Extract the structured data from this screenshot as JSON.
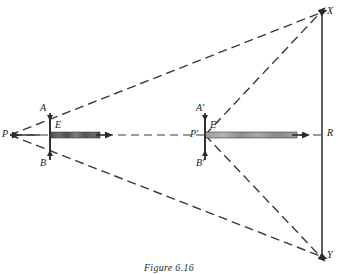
{
  "figure": {
    "caption": "Figure 6.16",
    "caption_y": 262
  },
  "colors": {
    "stroke": "#2b2b2b",
    "dash": "#3a3a3a",
    "beam_dark": "#5a5a5a",
    "beam_light": "#8d8d8d",
    "beam_edge": "#3d3d3d",
    "background": "#ffffff",
    "label": "#1a1a1a"
  },
  "points": [
    {
      "name": "P",
      "label": "P",
      "x": 10,
      "y": 135,
      "label_x": 2,
      "label_y": 130
    },
    {
      "name": "A",
      "label": "A",
      "x": 50,
      "y": 115,
      "label_x": 40,
      "label_y": 104
    },
    {
      "name": "E",
      "label": "E",
      "x": 50,
      "y": 135,
      "label_x": 55,
      "label_y": 122
    },
    {
      "name": "B",
      "label": "B",
      "x": 50,
      "y": 158,
      "label_x": 40,
      "label_y": 158
    },
    {
      "name": "P'",
      "label": "P'",
      "x": 205,
      "y": 135,
      "label_x": 192,
      "label_y": 130
    },
    {
      "name": "A'",
      "label": "A'",
      "x": 205,
      "y": 115,
      "label_x": 196,
      "label_y": 104
    },
    {
      "name": "E'",
      "label": "E'",
      "x": 205,
      "y": 135,
      "label_x": 210,
      "label_y": 122
    },
    {
      "name": "B'",
      "label": "B'",
      "x": 205,
      "y": 158,
      "label_x": 196,
      "label_y": 158
    },
    {
      "name": "X",
      "label": "X",
      "x": 322,
      "y": 12,
      "label_x": 327,
      "label_y": 6
    },
    {
      "name": "R",
      "label": "R",
      "x": 322,
      "y": 135,
      "label_x": 327,
      "label_y": 129
    },
    {
      "name": "Y",
      "label": "Y",
      "x": 322,
      "y": 257,
      "label_x": 327,
      "label_y": 249
    }
  ],
  "screen_line": {
    "x": 322,
    "y_top": 12,
    "y_bottom": 257
  },
  "axis": {
    "y": 135,
    "x_start": 10,
    "x_end": 322
  },
  "apertures": [
    {
      "name": "aperture-left",
      "x": 50,
      "y_top": 115,
      "y_bottom": 158
    },
    {
      "name": "aperture-right",
      "x": 205,
      "y_top": 115,
      "y_bottom": 158
    }
  ],
  "beams": [
    {
      "name": "beam-left",
      "x_start": 50,
      "x_end": 103,
      "y": 135,
      "thickness": 6,
      "shade": "dark"
    },
    {
      "name": "beam-right",
      "x_start": 205,
      "x_end": 300,
      "y": 135,
      "thickness": 6,
      "shade": "light"
    }
  ],
  "rays": [
    {
      "name": "ray-P-to-X",
      "from": "P",
      "to": "X",
      "x1": 10,
      "y1": 135,
      "x2": 322,
      "y2": 12
    },
    {
      "name": "ray-P-to-Y",
      "from": "P",
      "to": "Y",
      "x1": 10,
      "y1": 135,
      "x2": 322,
      "y2": 257
    },
    {
      "name": "ray-Pp-to-X",
      "from": "P'",
      "to": "X",
      "x1": 205,
      "y1": 135,
      "x2": 322,
      "y2": 12
    },
    {
      "name": "ray-Pp-to-Y",
      "from": "P'",
      "to": "Y",
      "x1": 205,
      "y1": 135,
      "x2": 322,
      "y2": 257
    }
  ]
}
